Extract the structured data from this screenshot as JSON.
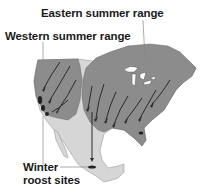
{
  "labels": {
    "eastern": "Eastern summer range",
    "western": "Western summer range",
    "winter_line1": "Winter",
    "winter_line2": "roost sites"
  },
  "colors": {
    "summer_range": "#8c8c8c",
    "land": "#d6d6d6",
    "arrows": "#2a2a2a",
    "water": "#ffffff",
    "leader_lines": "#888888"
  },
  "legend_regions": [
    "Eastern summer range",
    "Western summer range",
    "Winter roost sites"
  ]
}
